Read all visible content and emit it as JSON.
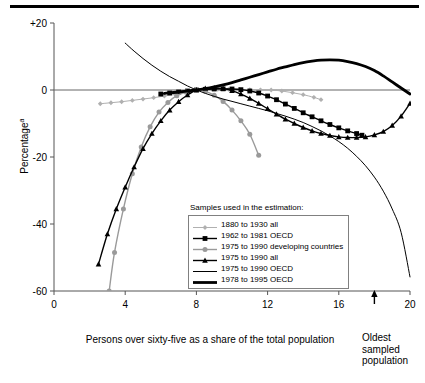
{
  "chart_data": {
    "type": "line",
    "title": "",
    "xlabel": "Persons over sixty-five as a share of the total population",
    "ylabel": "Percentage",
    "ylabel_sup": "a",
    "xlim": [
      0,
      20
    ],
    "ylim": [
      -60,
      20
    ],
    "xticks": [
      "0",
      "4",
      "8",
      "12",
      "16",
      "20"
    ],
    "xtick_values": [
      0,
      4,
      8,
      12,
      16,
      20
    ],
    "yticks": [
      "+20",
      "0",
      "-20",
      "-40",
      "-60"
    ],
    "ytick_values": [
      20,
      0,
      -20,
      -40,
      -60
    ],
    "grid": false,
    "legend_position": "center",
    "legend_title": "Samples used in the estimation:",
    "annotations": [
      {
        "name": "oldest-sampled-population",
        "text": "Oldest sampled population",
        "x": 18,
        "y": -60,
        "arrow": "up"
      }
    ],
    "series": [
      {
        "name": "1880 to 1930 all",
        "color": "#b0b0b0",
        "marker": "diamond",
        "width": 1,
        "points": [
          [
            2.6,
            -4.1
          ],
          [
            3.2,
            -3.8
          ],
          [
            3.8,
            -3.5
          ],
          [
            4.4,
            -3.1
          ],
          [
            5.0,
            -2.7
          ],
          [
            5.6,
            -2.3
          ],
          [
            6.2,
            -1.8
          ],
          [
            6.8,
            -1.3
          ],
          [
            7.4,
            -0.7
          ],
          [
            8.0,
            0.0
          ],
          [
            8.6,
            0.1
          ],
          [
            9.2,
            0.2
          ],
          [
            9.8,
            0.2
          ],
          [
            10.4,
            0.2
          ],
          [
            11.0,
            0.1
          ],
          [
            11.6,
            0.05
          ],
          [
            12.2,
            0.0
          ],
          [
            12.8,
            -0.3
          ],
          [
            13.4,
            -0.8
          ],
          [
            14.0,
            -1.4
          ],
          [
            14.6,
            -2.2
          ],
          [
            15.0,
            -2.9
          ]
        ]
      },
      {
        "name": "1962 to 1981 OECD",
        "color": "#000000",
        "marker": "square",
        "width": 1.4,
        "points": [
          [
            6.0,
            -1.2
          ],
          [
            6.5,
            -0.9
          ],
          [
            7.0,
            -0.6
          ],
          [
            7.5,
            -0.3
          ],
          [
            8.0,
            0.0
          ],
          [
            8.5,
            0.2
          ],
          [
            9.0,
            0.3
          ],
          [
            9.5,
            0.35
          ],
          [
            10.0,
            0.3
          ],
          [
            10.5,
            0.1
          ],
          [
            11.0,
            -0.3
          ],
          [
            11.5,
            -0.9
          ],
          [
            12.0,
            -1.8
          ],
          [
            12.5,
            -2.9
          ],
          [
            13.0,
            -4.2
          ],
          [
            13.5,
            -5.5
          ],
          [
            14.0,
            -6.8
          ],
          [
            14.5,
            -8.0
          ],
          [
            15.0,
            -9.2
          ],
          [
            15.5,
            -10.3
          ],
          [
            16.0,
            -11.3
          ],
          [
            16.5,
            -12.2
          ],
          [
            17.0,
            -13.0
          ],
          [
            17.3,
            -13.5
          ]
        ]
      },
      {
        "name": "1975 to 1990 developing countries",
        "color": "#9a9a9a",
        "marker": "circle",
        "width": 1.4,
        "points": [
          [
            3.1,
            -60.0
          ],
          [
            3.4,
            -48.5
          ],
          [
            3.9,
            -35.5
          ],
          [
            4.4,
            -25.0
          ],
          [
            4.9,
            -17.0
          ],
          [
            5.4,
            -11.0
          ],
          [
            5.9,
            -6.6
          ],
          [
            6.4,
            -3.7
          ],
          [
            6.9,
            -1.7
          ],
          [
            7.4,
            -0.6
          ],
          [
            8.0,
            0.0
          ],
          [
            8.5,
            -0.4
          ],
          [
            9.0,
            -1.6
          ],
          [
            9.5,
            -3.4
          ],
          [
            10.0,
            -6.0
          ],
          [
            10.5,
            -9.2
          ],
          [
            11.0,
            -13.2
          ],
          [
            11.5,
            -19.5
          ]
        ]
      },
      {
        "name": "1975 to 1990 all",
        "color": "#000000",
        "marker": "triangle",
        "width": 1.4,
        "points": [
          [
            2.5,
            -52.0
          ],
          [
            3.0,
            -43.0
          ],
          [
            3.5,
            -35.5
          ],
          [
            4.0,
            -29.0
          ],
          [
            4.5,
            -23.0
          ],
          [
            5.0,
            -17.5
          ],
          [
            5.5,
            -13.0
          ],
          [
            6.0,
            -9.2
          ],
          [
            6.5,
            -6.0
          ],
          [
            7.0,
            -3.5
          ],
          [
            7.5,
            -1.5
          ],
          [
            8.0,
            0.0
          ],
          [
            8.5,
            0.5
          ],
          [
            9.0,
            0.6
          ],
          [
            9.5,
            0.4
          ],
          [
            10.0,
            -0.2
          ],
          [
            10.5,
            -1.2
          ],
          [
            11.0,
            -2.5
          ],
          [
            11.5,
            -4.0
          ],
          [
            12.0,
            -5.6
          ],
          [
            12.5,
            -7.2
          ],
          [
            13.0,
            -8.7
          ],
          [
            13.5,
            -10.0
          ],
          [
            14.0,
            -11.2
          ],
          [
            14.5,
            -12.2
          ],
          [
            15.0,
            -13.0
          ],
          [
            15.5,
            -13.6
          ],
          [
            16.0,
            -14.0
          ],
          [
            16.5,
            -14.2
          ],
          [
            17.0,
            -14.2
          ],
          [
            17.5,
            -14.0
          ],
          [
            18.0,
            -13.4
          ],
          [
            18.5,
            -12.4
          ],
          [
            19.0,
            -10.6
          ],
          [
            19.5,
            -7.8
          ],
          [
            20.0,
            -4.0
          ]
        ]
      },
      {
        "name": "1975 to 1990 OECD",
        "color": "#000000",
        "marker": "none",
        "width": 1,
        "points": [
          [
            4.0,
            14.0
          ],
          [
            4.5,
            11.6
          ],
          [
            5.0,
            9.4
          ],
          [
            5.5,
            7.4
          ],
          [
            6.0,
            5.6
          ],
          [
            6.5,
            4.0
          ],
          [
            7.0,
            2.6
          ],
          [
            7.5,
            1.2
          ],
          [
            8.0,
            0.0
          ],
          [
            8.5,
            -1.0
          ],
          [
            9.0,
            -1.9
          ],
          [
            9.5,
            -2.7
          ],
          [
            10.0,
            -3.4
          ],
          [
            10.5,
            -4.1
          ],
          [
            11.0,
            -4.8
          ],
          [
            11.5,
            -5.5
          ],
          [
            12.0,
            -6.2
          ],
          [
            12.5,
            -7.0
          ],
          [
            13.0,
            -7.8
          ],
          [
            13.5,
            -8.7
          ],
          [
            14.0,
            -9.7
          ],
          [
            14.5,
            -10.9
          ],
          [
            15.0,
            -12.2
          ],
          [
            15.5,
            -13.7
          ],
          [
            16.0,
            -15.4
          ],
          [
            16.5,
            -17.4
          ],
          [
            17.0,
            -19.8
          ],
          [
            17.5,
            -22.6
          ],
          [
            18.0,
            -26.0
          ],
          [
            18.5,
            -30.2
          ],
          [
            19.0,
            -35.5
          ],
          [
            19.5,
            -42.5
          ],
          [
            20.0,
            -55.8
          ]
        ]
      },
      {
        "name": "1978 to 1995 OECD",
        "color": "#000000",
        "marker": "none",
        "width": 2.8,
        "points": [
          [
            6.2,
            -1.0
          ],
          [
            6.6,
            -0.8
          ],
          [
            7.0,
            -0.6
          ],
          [
            7.5,
            -0.3
          ],
          [
            8.0,
            0.0
          ],
          [
            8.5,
            0.4
          ],
          [
            9.0,
            0.9
          ],
          [
            9.5,
            1.5
          ],
          [
            10.0,
            2.2
          ],
          [
            10.5,
            3.0
          ],
          [
            11.0,
            3.8
          ],
          [
            11.5,
            4.6
          ],
          [
            12.0,
            5.4
          ],
          [
            12.5,
            6.2
          ],
          [
            13.0,
            6.9
          ],
          [
            13.5,
            7.6
          ],
          [
            14.0,
            8.2
          ],
          [
            14.5,
            8.6
          ],
          [
            15.0,
            8.9
          ],
          [
            15.5,
            9.0
          ],
          [
            16.0,
            8.9
          ],
          [
            16.5,
            8.5
          ],
          [
            17.0,
            7.9
          ],
          [
            17.5,
            7.0
          ],
          [
            18.0,
            5.8
          ],
          [
            18.5,
            4.2
          ],
          [
            19.0,
            2.4
          ],
          [
            19.5,
            0.6
          ],
          [
            20.0,
            -1.2
          ]
        ]
      }
    ]
  },
  "legend": {
    "caption": "Samples used in the estimation:",
    "items": [
      {
        "label": "1880 to 1930 all"
      },
      {
        "label": "1962 to 1981 OECD"
      },
      {
        "label": "1975 to 1990 developing countries"
      },
      {
        "label": "1975 to 1990 all"
      },
      {
        "label": "1975 to 1990 OECD"
      },
      {
        "label": "1978 to 1995 OECD"
      }
    ]
  },
  "axes": {
    "y_title": "Percentage",
    "y_title_sup": "a",
    "x_title": "Persons over sixty-five as a share of the total population"
  },
  "annotation": {
    "oldest_line1": "Oldest",
    "oldest_line2": "sampled",
    "oldest_line3": "population"
  },
  "colors": {
    "axis": "#555555",
    "series_light_gray": "#b0b0b0",
    "series_mid_gray": "#9a9a9a",
    "series_black": "#000000",
    "legend_border": "#808080"
  }
}
